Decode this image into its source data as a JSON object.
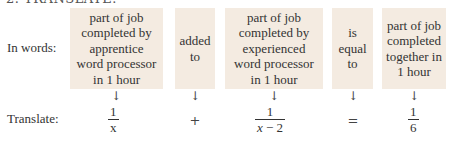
{
  "heading": "2. TRANSLATE.",
  "rows": {
    "words_label": "In words:",
    "translate_label": "Translate:"
  },
  "boxes": [
    {
      "text": "part of job\ncompleted by\napprentice\nword processor\nin 1 hour"
    },
    {
      "text": "added\nto"
    },
    {
      "text": "part of job\ncompleted by\nexperienced\nword processor\nin 1 hour"
    },
    {
      "text": "is\nequal\nto"
    },
    {
      "text": "part of job\ncompleted\ntogether in\n1 hour"
    }
  ],
  "arrow_glyph": "↓",
  "translation": {
    "term1": {
      "numerator": "1",
      "denominator": "x"
    },
    "op1": "+",
    "term2": {
      "numerator": "1",
      "denominator_var": "x",
      "denominator_rest": " − 2"
    },
    "op2": "=",
    "term3": {
      "numerator": "1",
      "denominator": "6"
    }
  },
  "colors": {
    "box_background": "#f4ebe1",
    "text": "#333333"
  }
}
